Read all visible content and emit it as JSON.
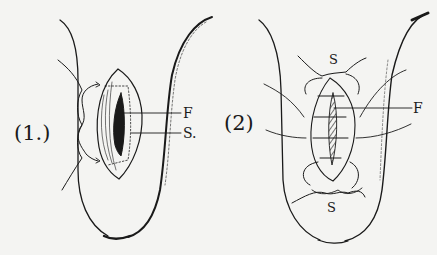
{
  "figures": [
    {
      "id": "fig1",
      "label": "(1.)",
      "annotations": [
        {
          "key": "F",
          "text": "F"
        },
        {
          "key": "S",
          "text": "S."
        }
      ]
    },
    {
      "id": "fig2",
      "label": "(2)",
      "annotations": [
        {
          "key": "S_top",
          "text": "S"
        },
        {
          "key": "F",
          "text": "F"
        },
        {
          "key": "S_bottom",
          "text": "S"
        }
      ]
    }
  ],
  "colors": {
    "ink": "#1a1a1a",
    "paper": "#f4f4f2"
  }
}
